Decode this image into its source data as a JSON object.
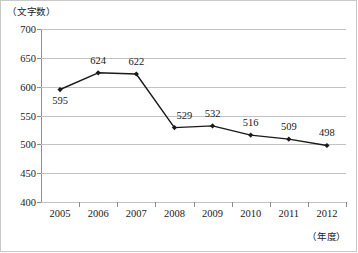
{
  "chart_data": {
    "type": "line",
    "title": "",
    "xlabel": "（年度）",
    "ylabel": "（文字数）",
    "categories": [
      "2005",
      "2006",
      "2007",
      "2008",
      "2009",
      "2010",
      "2011",
      "2012"
    ],
    "values": [
      595,
      624,
      622,
      529,
      532,
      516,
      509,
      498
    ],
    "point_labels": [
      "595",
      "624",
      "622",
      "529",
      "532",
      "516",
      "509",
      "498"
    ],
    "ylim": [
      400,
      700
    ],
    "yticks": [
      700,
      650,
      600,
      550,
      500,
      450,
      400
    ],
    "ytick_labels": [
      "700",
      "650",
      "600",
      "550",
      "500",
      "450",
      "400"
    ],
    "grid": true,
    "legend": "none",
    "series": [
      {
        "name": "文字数",
        "values": [
          595,
          624,
          622,
          529,
          532,
          516,
          509,
          498
        ],
        "line_color": "#1a1a1a",
        "marker": "filled-diamond",
        "marker_color": "#1a1a1a"
      }
    ],
    "colors": {
      "line": "#1a1a1a",
      "marker": "#1a1a1a",
      "grid": "#c2c2c2",
      "axis": "#8d8d8d",
      "text": "#1a1a1a",
      "background": "#ffffff",
      "border": "#c9c9c9"
    }
  }
}
